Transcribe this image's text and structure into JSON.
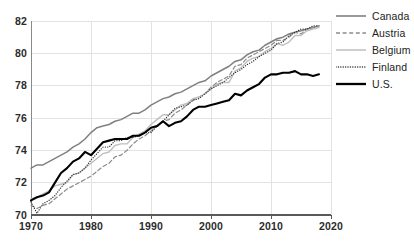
{
  "chart_data": {
    "type": "line",
    "title": "",
    "subtitle": "",
    "xlabel": "",
    "ylabel": "",
    "xlim": [
      1970,
      2020
    ],
    "ylim": [
      70,
      82
    ],
    "grid": true,
    "legend_position": "right",
    "xticks": [
      "1970",
      "1980",
      "1990",
      "2000",
      "2010",
      "2020"
    ],
    "yticks": [
      "70",
      "72",
      "74",
      "76",
      "78",
      "80",
      "82"
    ],
    "x": [
      1970,
      1971,
      1972,
      1973,
      1974,
      1975,
      1976,
      1977,
      1978,
      1979,
      1980,
      1981,
      1982,
      1983,
      1984,
      1985,
      1986,
      1987,
      1988,
      1989,
      1990,
      1991,
      1992,
      1993,
      1994,
      1995,
      1996,
      1997,
      1998,
      1999,
      2000,
      2001,
      2002,
      2003,
      2004,
      2005,
      2006,
      2007,
      2008,
      2009,
      2010,
      2011,
      2012,
      2013,
      2014,
      2015,
      2016,
      2017,
      2018
    ],
    "series": [
      {
        "name": "Canada",
        "color": "#808080",
        "style": "solid",
        "width": 1.5,
        "values": [
          72.9,
          73.1,
          73.1,
          73.3,
          73.5,
          73.7,
          73.9,
          74.2,
          74.4,
          74.7,
          75.1,
          75.4,
          75.5,
          75.6,
          75.8,
          75.9,
          76.1,
          76.3,
          76.3,
          76.5,
          76.8,
          77.0,
          77.2,
          77.3,
          77.5,
          77.6,
          77.8,
          78.0,
          78.2,
          78.3,
          78.6,
          78.8,
          79.0,
          79.2,
          79.5,
          79.6,
          79.9,
          80.1,
          80.2,
          80.5,
          80.7,
          80.9,
          81.0,
          81.2,
          81.3,
          81.4,
          81.5,
          81.6,
          81.7
        ]
      },
      {
        "name": "Austria",
        "color": "#8c8c8c",
        "style": "dashed",
        "width": 1.2,
        "values": [
          70.6,
          70.4,
          70.6,
          70.7,
          71.0,
          71.3,
          71.6,
          71.8,
          72.0,
          72.2,
          72.4,
          72.7,
          73.0,
          73.2,
          73.6,
          73.7,
          74.0,
          74.4,
          74.7,
          74.9,
          75.2,
          75.5,
          75.8,
          75.9,
          76.3,
          76.5,
          76.8,
          77.1,
          77.3,
          77.5,
          77.9,
          78.2,
          78.4,
          78.6,
          79.2,
          79.3,
          79.7,
          79.9,
          80.1,
          80.3,
          80.5,
          80.8,
          80.8,
          81.0,
          81.3,
          81.2,
          81.5,
          81.6,
          81.7
        ]
      },
      {
        "name": "Belgium",
        "color": "#bfbfbf",
        "style": "solid",
        "width": 1.4,
        "values": [
          71.0,
          71.1,
          71.3,
          71.5,
          71.8,
          71.9,
          72.0,
          72.5,
          72.6,
          72.9,
          73.2,
          73.5,
          73.8,
          73.9,
          74.3,
          74.4,
          74.4,
          74.8,
          75.0,
          75.2,
          75.6,
          75.9,
          76.2,
          76.2,
          76.5,
          76.8,
          76.9,
          77.2,
          77.3,
          77.5,
          77.8,
          78.1,
          78.2,
          78.2,
          78.9,
          79.1,
          79.5,
          79.7,
          79.8,
          80.1,
          80.3,
          80.6,
          80.5,
          80.7,
          81.1,
          81.1,
          81.4,
          81.5,
          81.6
        ]
      },
      {
        "name": "Finland",
        "color": "#333333",
        "style": "dotted",
        "width": 1.3,
        "values": [
          70.8,
          70.1,
          70.7,
          70.9,
          71.2,
          71.7,
          72.1,
          72.5,
          72.6,
          72.9,
          73.4,
          73.8,
          74.2,
          74.2,
          74.6,
          74.6,
          74.8,
          74.8,
          74.9,
          75.1,
          75.1,
          75.5,
          75.8,
          76.2,
          76.6,
          76.7,
          76.8,
          77.1,
          77.2,
          77.5,
          77.8,
          78.0,
          78.2,
          78.5,
          78.8,
          79.0,
          79.3,
          79.5,
          79.8,
          80.0,
          80.2,
          80.6,
          80.7,
          81.1,
          81.3,
          81.5,
          81.5,
          81.7,
          81.7
        ]
      },
      {
        "name": "U.S.",
        "color": "#000000",
        "style": "solid",
        "width": 2.1,
        "values": [
          70.9,
          71.1,
          71.2,
          71.4,
          72.0,
          72.6,
          72.9,
          73.3,
          73.5,
          73.9,
          73.7,
          74.1,
          74.5,
          74.6,
          74.7,
          74.7,
          74.7,
          74.9,
          74.9,
          75.1,
          75.4,
          75.5,
          75.8,
          75.5,
          75.7,
          75.8,
          76.1,
          76.5,
          76.7,
          76.7,
          76.8,
          76.9,
          77.0,
          77.1,
          77.5,
          77.4,
          77.7,
          77.9,
          78.1,
          78.5,
          78.7,
          78.7,
          78.8,
          78.8,
          78.9,
          78.7,
          78.7,
          78.6,
          78.7
        ]
      }
    ]
  },
  "legend": {
    "items": [
      {
        "label": "Canada",
        "swatch": "legend-line-solid-gray"
      },
      {
        "label": "Austria",
        "swatch": "legend-line-dashed-gray"
      },
      {
        "label": "Belgium",
        "swatch": "legend-line-solid-lightgray"
      },
      {
        "label": "Finland",
        "swatch": "legend-line-dotted-dark"
      },
      {
        "label": "U.S.",
        "swatch": "legend-line-solid-black"
      }
    ]
  },
  "axes": {
    "y_labels": [
      "82",
      "80",
      "78",
      "76",
      "74",
      "72",
      "70"
    ],
    "x_labels": [
      "1970",
      "1980",
      "1990",
      "2000",
      "2010",
      "2020"
    ]
  }
}
